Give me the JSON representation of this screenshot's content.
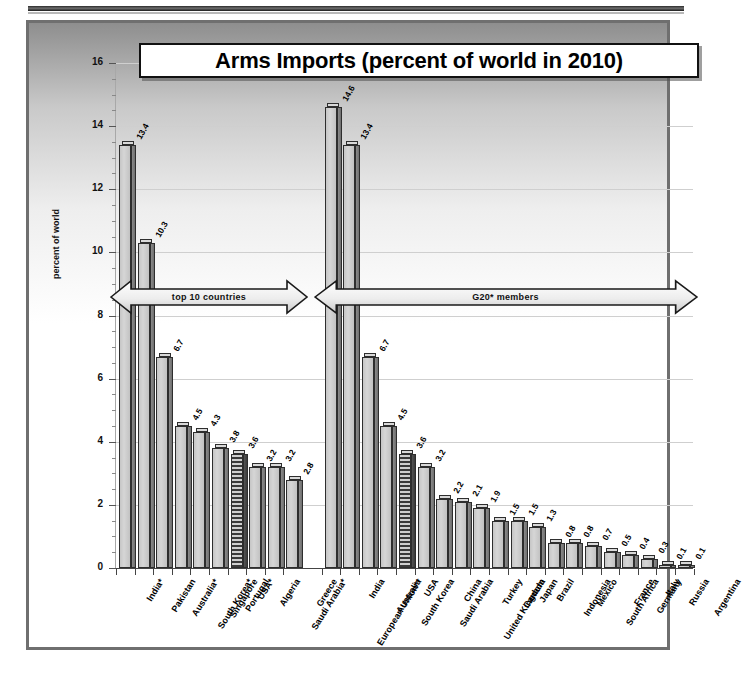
{
  "chart_data": {
    "type": "bar",
    "title": "Arms Imports (percent of world in 2010)",
    "xlabel": "",
    "ylabel": "percent of world",
    "ylim": [
      0,
      16
    ],
    "ytick_step": 2,
    "yticks": [
      "0",
      "2",
      "4",
      "6",
      "8",
      "10",
      "12",
      "14",
      "16"
    ],
    "grid": true,
    "legend": "none",
    "groups": [
      {
        "name": "top 10 countries",
        "annotation": "top 10 countries",
        "categories": [
          "India*",
          "Pakistan",
          "Australia*",
          "South Korea*",
          "Singapore",
          "Portugal",
          "USA*",
          "Algeria",
          "Saudi Arabia*",
          "Greece"
        ],
        "values": [
          13.4,
          10.3,
          6.7,
          4.5,
          4.3,
          3.8,
          3.6,
          3.2,
          3.2,
          2.8
        ],
        "highlighted": [
          "USA*"
        ]
      },
      {
        "name": "G20 members",
        "annotation": "G20* members",
        "categories": [
          "European Union**",
          "India",
          "Australia",
          "South Korea",
          "USA",
          "Saudi Arabia",
          "China",
          "United Kingdom",
          "Turkey",
          "Canada",
          "Japan",
          "Brazil",
          "Indonesia",
          "Mexico",
          "South Africa",
          "France",
          "Germany",
          "Italy",
          "Russia",
          "Argentina"
        ],
        "values": [
          14.6,
          13.4,
          6.7,
          4.5,
          3.6,
          3.2,
          2.2,
          2.1,
          1.9,
          1.5,
          1.5,
          1.3,
          0.8,
          0.8,
          0.7,
          0.5,
          0.4,
          0.3,
          0.1,
          0.1
        ],
        "highlighted": [
          "USA"
        ]
      }
    ],
    "colors": {
      "bar_face": "#cccccc",
      "bar_side": "#7a7a7a",
      "bar_outline": "#2e2e2e",
      "highlight_pattern": "#3a3a3a",
      "gridline": "#cfcfcf",
      "frame": "#6f6f6f"
    }
  }
}
